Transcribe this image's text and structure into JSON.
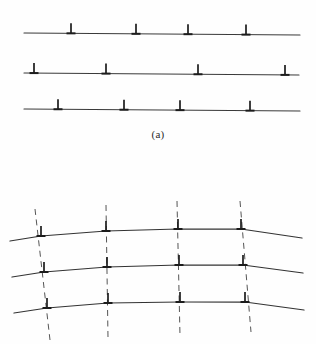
{
  "figure": {
    "background_color": "#fefefe",
    "line_color": "#333333",
    "dashed_color": "#555555",
    "symbol_color": "#1c1c1c",
    "width": 316,
    "height": 344
  },
  "captions": {
    "panel_a": "(a)",
    "panel_b": ""
  },
  "chart_data": {
    "type": "diagram",
    "xlabel": "",
    "ylabel": "",
    "panels": [
      {
        "id": "a",
        "label": "(a)",
        "description": "Randomly distributed edge dislocations on three parallel straight slip planes (bent crystal, before polygonization)",
        "slip_planes": [
          {
            "index": 0,
            "x_start": 24,
            "y_start": 33,
            "x_end": 300,
            "y_end": 35,
            "dislocations_x": [
              71,
              136,
              188,
              246
            ]
          },
          {
            "index": 1,
            "x_start": 24,
            "y_start": 73,
            "x_end": 299,
            "y_end": 75,
            "dislocations_x": [
              34,
              106,
              198,
              285
            ]
          },
          {
            "index": 2,
            "x_start": 24,
            "y_start": 109,
            "x_end": 300,
            "y_end": 111,
            "dislocations_x": [
              58,
              124,
              180,
              250
            ]
          }
        ]
      },
      {
        "id": "b",
        "label": "",
        "description": "Edge dislocations aligned into vertical tilt walls forming small-angle boundaries; slip planes kinked at each wall (after polygonization)",
        "boundary_walls": [
          {
            "index": 0,
            "x_top": 35,
            "y_top": 209,
            "x_bottom": 50,
            "y_bottom": 340
          },
          {
            "index": 1,
            "x_top": 106,
            "y_top": 205,
            "x_bottom": 108,
            "y_bottom": 338
          },
          {
            "index": 2,
            "x_top": 177,
            "y_top": 201,
            "x_bottom": 180,
            "y_bottom": 336
          },
          {
            "index": 3,
            "x_top": 240,
            "y_top": 201,
            "x_bottom": 251,
            "y_bottom": 332
          }
        ],
        "kinked_planes": [
          {
            "index": 0,
            "points": [
              [
                10,
                241
              ],
              [
                41,
                236
              ],
              [
                106,
                231
              ],
              [
                178,
                229
              ],
              [
                241,
                229
              ],
              [
                302,
                238
              ]
            ],
            "dislocations_x": [
              41,
              106,
              178,
              241
            ]
          },
          {
            "index": 1,
            "points": [
              [
                12,
                277
              ],
              [
                44,
                272
              ],
              [
                107,
                267
              ],
              [
                179,
                265
              ],
              [
                243,
                265
              ],
              [
                303,
                273
              ]
            ],
            "dislocations_x": [
              44,
              107,
              179,
              243
            ]
          },
          {
            "index": 2,
            "points": [
              [
                14,
                313
              ],
              [
                47,
                308
              ],
              [
                108,
                303
              ],
              [
                180,
                302
              ],
              [
                245,
                302
              ],
              [
                304,
                310
              ]
            ],
            "dislocations_x": [
              47,
              108,
              180,
              245
            ]
          }
        ]
      }
    ],
    "symbols": {
      "dislocation_glyph": "perpendicular-tack",
      "glyph_unicode": "⊥",
      "stem_height": 10,
      "bar_width": 9
    },
    "legend": [],
    "grid": false,
    "annotations": []
  }
}
